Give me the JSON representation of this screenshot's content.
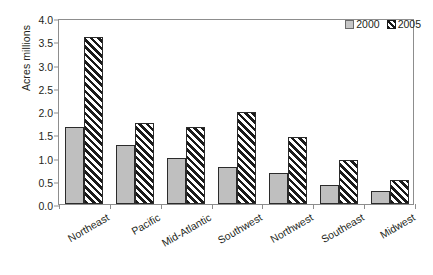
{
  "chart_data": {
    "type": "bar",
    "title": "",
    "xlabel": "",
    "ylabel": "Acres millions",
    "ylim": [
      0,
      4.0
    ],
    "ytick_step": 0.5,
    "yticks": [
      "0.0",
      "0.5",
      "1.0",
      "1.5",
      "2.0",
      "2.5",
      "3.0",
      "3.5",
      "4.0"
    ],
    "grid": false,
    "legend_position": "top-right",
    "categories": [
      "Northeast",
      "Pacific",
      "Mid-Atlantic",
      "Southwest",
      "Northwest",
      "Southeast",
      "Midwest"
    ],
    "series": [
      {
        "name": "2000",
        "style": "solid-gray",
        "color": "#bfbfbf",
        "values": [
          1.65,
          1.27,
          0.98,
          0.8,
          0.67,
          0.4,
          0.29
        ]
      },
      {
        "name": "2005",
        "style": "diagonal-hatch",
        "color": "#1a1a1a",
        "values": [
          3.6,
          1.75,
          1.65,
          1.97,
          1.44,
          0.95,
          0.51
        ]
      }
    ]
  },
  "legend": {
    "entries": [
      {
        "label": "2000"
      },
      {
        "label": "2005"
      }
    ]
  },
  "colors": {
    "series_2000": "#bfbfbf",
    "series_2005": "#1a1a1a",
    "frame": "#8d8d8d",
    "text": "#231f20",
    "background": "#ffffff"
  }
}
